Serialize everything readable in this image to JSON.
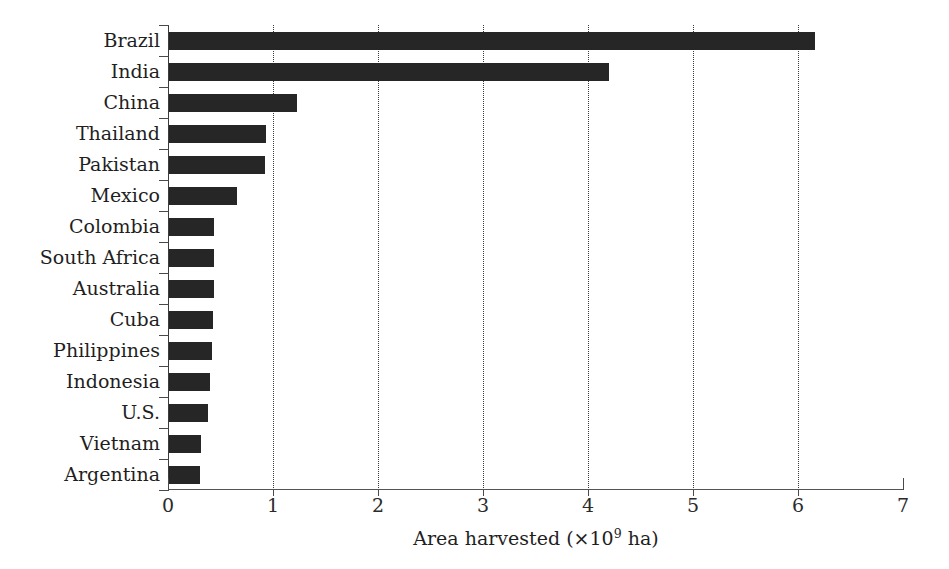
{
  "chart_data": {
    "type": "bar",
    "orientation": "horizontal",
    "title": "",
    "subtitle": "",
    "xlabel": "Area harvested (×10⁹ ha)",
    "xlabel_parts": {
      "prefix": "Area harvested (×10",
      "exponent": "9",
      "suffix": " ha)"
    },
    "ylabel": "",
    "categories": [
      "Brazil",
      "India",
      "China",
      "Thailand",
      "Pakistan",
      "Mexico",
      "Colombia",
      "South Africa",
      "Australia",
      "Cuba",
      "Philippines",
      "Indonesia",
      "U.S.",
      "Vietnam",
      "Argentina"
    ],
    "values": [
      6.16,
      4.2,
      1.23,
      0.93,
      0.92,
      0.66,
      0.44,
      0.44,
      0.44,
      0.43,
      0.42,
      0.4,
      0.38,
      0.31,
      0.3
    ],
    "xlim": [
      0,
      7
    ],
    "xticks": [
      0,
      1,
      2,
      3,
      4,
      5,
      6,
      7
    ],
    "xtick_labels": [
      "0",
      "1",
      "2",
      "3",
      "4",
      "5",
      "6",
      "7"
    ],
    "gridlines_x": [
      1,
      2,
      3,
      4,
      5,
      6
    ],
    "grid": true,
    "grid_style": "dotted",
    "legend": null,
    "legend_position": "none",
    "bar_color": "#262626",
    "axis_color": "#4a4a4a",
    "background_color": "#ffffff"
  }
}
